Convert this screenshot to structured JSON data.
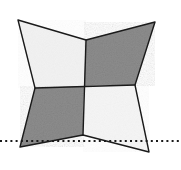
{
  "canvas": {
    "width": 181,
    "height": 170,
    "background": "#ffffff"
  },
  "figure": {
    "name": "four-pointed-star-checkerboard",
    "outline_color": "#1a1a1a",
    "outline_width": 1.4,
    "center_point": {
      "x": 84,
      "y": 86
    },
    "outer_tips": [
      {
        "name": "top-left-tip",
        "x": 18,
        "y": 20
      },
      {
        "name": "top-right-tip",
        "x": 155,
        "y": 22
      },
      {
        "name": "bottom-right-tip",
        "x": 149,
        "y": 152
      },
      {
        "name": "bottom-left-tip",
        "x": 20,
        "y": 147
      }
    ],
    "concave_notches": [
      {
        "name": "top-notch",
        "x": 86,
        "y": 40
      },
      {
        "name": "right-notch",
        "x": 135,
        "y": 85
      },
      {
        "name": "bottom-notch",
        "x": 83,
        "y": 135
      },
      {
        "name": "left-notch",
        "x": 35,
        "y": 88
      }
    ],
    "outline_path": "M 18 20 L 86 40 L 155 22 L 135 85 L 149 152 L 83 135 L 20 147 L 35 88 Z",
    "quadrants": [
      {
        "name": "top-left-quadrant",
        "shade": "light",
        "fill": "#f2f2f2",
        "path": "M 18 20 L 86 40 L 84 86 L 35 88 Z"
      },
      {
        "name": "top-right-quadrant",
        "shade": "dark",
        "fill": "#8d8d8d",
        "path": "M 86 40 L 155 22 L 135 85 L 84 86 Z"
      },
      {
        "name": "bottom-right-quadrant",
        "shade": "light",
        "fill": "#f5f5f5",
        "path": "M 84 86 L 135 85 L 149 152 L 83 135 Z"
      },
      {
        "name": "bottom-left-quadrant",
        "shade": "dark",
        "fill": "#8d8d8d",
        "path": "M 35 88 L 84 86 L 83 135 L 20 147 Z"
      }
    ],
    "internal_dividers": [
      {
        "name": "vertical-divider",
        "x1": 86,
        "y1": 40,
        "x2": 83,
        "y2": 135
      },
      {
        "name": "horizontal-divider",
        "x1": 35,
        "y1": 88,
        "x2": 135,
        "y2": 85
      }
    ]
  },
  "dotted_line": {
    "name": "horizontal-dotted-baseline",
    "y": 141,
    "x_start": 0,
    "x_end": 181,
    "color": "#1a1a1a",
    "dot_size": 2,
    "dot_gap": 3.2,
    "stroke_width": 2.2
  },
  "texture": {
    "dark_noise_color": "#7a7a7a",
    "light_noise_color": "#e6e6e6"
  }
}
